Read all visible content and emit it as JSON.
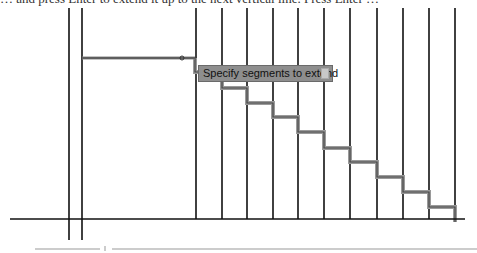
{
  "instruction_text": "… and press Enter to extend it up to the next vertical line. Press Enter …",
  "tooltip": {
    "label": "Specify segments to extend",
    "icon": "dropdown-arrow-icon"
  },
  "colors": {
    "line": "#111111",
    "highlight": "#8a8a8a",
    "tooltip_bg": "#8e8e8e"
  }
}
